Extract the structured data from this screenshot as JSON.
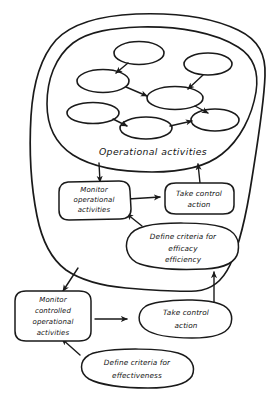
{
  "diagram": {
    "style": "hand-drawn sketch",
    "ink_color": "#1a1a1a",
    "background_color": "#ffffff",
    "region_label": "Operational activities",
    "inner_network": {
      "node_count": 6,
      "nodes": [
        {
          "id": "n1",
          "label": ""
        },
        {
          "id": "n2",
          "label": ""
        },
        {
          "id": "n3",
          "label": ""
        },
        {
          "id": "n4",
          "label": ""
        },
        {
          "id": "n5",
          "label": ""
        },
        {
          "id": "n6",
          "label": ""
        }
      ],
      "edges": [
        {
          "from": "n1",
          "to": "n3"
        },
        {
          "from": "n3",
          "to": "n4"
        },
        {
          "from": "n2",
          "to": "n4"
        },
        {
          "from": "n4",
          "to": "n6"
        },
        {
          "from": "n5",
          "to": "n6b"
        },
        {
          "from": "n6b",
          "to": "n6"
        }
      ]
    },
    "nodes": {
      "monitor_operational": {
        "lines": [
          "Monitor",
          "operational",
          "activities"
        ]
      },
      "take_control_action_upper": {
        "lines": [
          "Take control",
          "action"
        ]
      },
      "define_criteria_efficacy": {
        "lines": [
          "Define criteria for",
          "efficacy",
          "efficiency"
        ]
      },
      "monitor_controlled": {
        "lines": [
          "Monitor",
          "controlled",
          "operational",
          "activities"
        ]
      },
      "take_control_action_lower": {
        "lines": [
          "Take control",
          "action"
        ]
      },
      "define_criteria_effectiveness": {
        "lines": [
          "Define criteria for",
          "effectiveness"
        ]
      }
    },
    "arrows": [
      {
        "name": "operational-to-monitor",
        "from": "Operational activities",
        "to": "Monitor operational activities"
      },
      {
        "name": "monitor-to-take-control-upper",
        "from": "Monitor operational activities",
        "to": "Take control action"
      },
      {
        "name": "take-control-to-operational",
        "from": "Take control action",
        "to": "Operational activities"
      },
      {
        "name": "criteria-efficacy-to-monitor",
        "from": "Define criteria for efficacy efficiency",
        "to": "Monitor operational activities"
      },
      {
        "name": "system-to-monitor-controlled",
        "from": "Operational activities system",
        "to": "Monitor controlled operational activities"
      },
      {
        "name": "monitor-controlled-to-take-control-lower",
        "from": "Monitor controlled operational activities",
        "to": "Take control action"
      },
      {
        "name": "take-control-lower-to-system",
        "from": "Take control action",
        "to": "Operational activities system"
      },
      {
        "name": "criteria-effectiveness-to-monitor-controlled",
        "from": "Define criteria for effectiveness",
        "to": "Monitor controlled operational activities"
      }
    ]
  }
}
